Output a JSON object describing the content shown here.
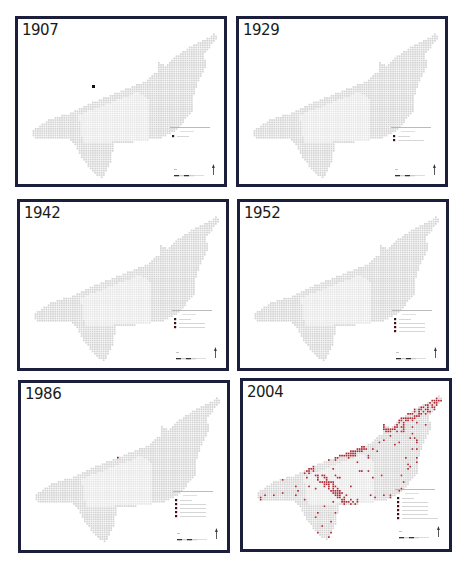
{
  "figure": {
    "colors": {
      "frame": "#1b1f3b",
      "grid_light": "#d3d3d3",
      "grid_zone": "#e6e6e6",
      "urban_dark": "#5c0a10",
      "urban_mid": "#8b1a22",
      "urban_light": "#a82a33"
    },
    "panels": [
      {
        "year": "1907",
        "legend_rows": 1
      },
      {
        "year": "1929",
        "legend_rows": 2
      },
      {
        "year": "1942",
        "legend_rows": 3
      },
      {
        "year": "1952",
        "legend_rows": 4
      },
      {
        "year": "1986",
        "legend_rows": 5
      },
      {
        "year": "2004",
        "legend_rows": 6
      }
    ],
    "icons": {
      "north_arrow": "north-arrow-icon",
      "scale_bar": "scale-bar-icon"
    }
  }
}
